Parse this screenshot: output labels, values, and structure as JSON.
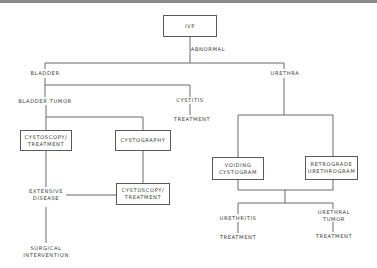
{
  "diagram": {
    "type": "flowchart",
    "nodes": {
      "ivp": "IVP",
      "abnormal": "ABNORMAL",
      "bladder": "BLADDER",
      "urethra": "URETHRA",
      "bladder_tumor": "BLADDER TUMOR",
      "cystitis": "CYSTITIS",
      "cystitis_treatment": "TREATMENT",
      "cystoscopy_treatment_1": "CYSTOSCOPY/\nTREATMENT",
      "cystography": "CYSTOGRAPHY",
      "extensive_disease": "EXTENSIVE\nDISEASE",
      "cystoscopy_treatment_2": "CYSTOSCOPY/\nTREATMENT",
      "surgical_intervention": "SURGICAL\nINTERVENTION",
      "voiding_cystogram": "VOIDING\nCYSTOGRAM",
      "retrograde_urethrogram": "RETROGRADE\nURETHROGRAM",
      "urethritis": "URETHRITIS",
      "urethritis_treatment": "TREATMENT",
      "urethral_tumor": "URETHRAL\nTUMOR",
      "urethral_tumor_treatment": "TREATMENT"
    },
    "edges": [
      [
        "IVP",
        "BLADDER",
        "ABNORMAL"
      ],
      [
        "IVP",
        "URETHRA",
        "ABNORMAL"
      ],
      [
        "BLADDER",
        "BLADDER TUMOR"
      ],
      [
        "BLADDER",
        "CYSTITIS"
      ],
      [
        "CYSTITIS",
        "TREATMENT"
      ],
      [
        "BLADDER TUMOR",
        "CYSTOSCOPY/TREATMENT"
      ],
      [
        "BLADDER TUMOR",
        "CYSTOGRAPHY"
      ],
      [
        "CYSTOSCOPY/TREATMENT",
        "EXTENSIVE DISEASE"
      ],
      [
        "CYSTOGRAPHY",
        "CYSTOSCOPY/TREATMENT"
      ],
      [
        "CYSTOSCOPY/TREATMENT",
        "EXTENSIVE DISEASE"
      ],
      [
        "EXTENSIVE DISEASE",
        "SURGICAL INTERVENTION"
      ],
      [
        "URETHRA",
        "VOIDING CYSTOGRAM"
      ],
      [
        "URETHRA",
        "RETROGRADE URETHROGRAM"
      ],
      [
        "VOIDING CYSTOGRAM",
        "URETHRITIS"
      ],
      [
        "VOIDING CYSTOGRAM",
        "URETHRAL TUMOR"
      ],
      [
        "RETROGRADE URETHROGRAM",
        "URETHRITIS"
      ],
      [
        "RETROGRADE URETHROGRAM",
        "URETHRAL TUMOR"
      ],
      [
        "URETHRITIS",
        "TREATMENT"
      ],
      [
        "URETHRAL TUMOR",
        "TREATMENT"
      ]
    ]
  },
  "colors": {
    "line": "#5a5a5a",
    "text": "#3a3a3a",
    "topbar": "#8a8a8a"
  }
}
